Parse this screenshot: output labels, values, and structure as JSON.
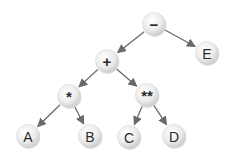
{
  "diagram": {
    "type": "expression-tree",
    "node_fill_light": "#fafafa",
    "node_fill_dark": "#d2d2d2",
    "edge_color": "#6a6a6a",
    "nodes": [
      {
        "id": "minus",
        "label": "−",
        "kind": "operator",
        "x": 154,
        "y": 24
      },
      {
        "id": "plus",
        "label": "+",
        "kind": "operator",
        "x": 107,
        "y": 61
      },
      {
        "id": "E",
        "label": "E",
        "kind": "operand",
        "x": 207,
        "y": 53
      },
      {
        "id": "times",
        "label": "*",
        "kind": "operator",
        "x": 69,
        "y": 96
      },
      {
        "id": "power",
        "label": "**",
        "kind": "operator",
        "x": 147,
        "y": 95
      },
      {
        "id": "A",
        "label": "A",
        "kind": "operand",
        "x": 28,
        "y": 136
      },
      {
        "id": "B",
        "label": "B",
        "kind": "operand",
        "x": 90,
        "y": 136
      },
      {
        "id": "C",
        "label": "C",
        "kind": "operand",
        "x": 129,
        "y": 137
      },
      {
        "id": "D",
        "label": "D",
        "kind": "operand",
        "x": 174,
        "y": 136
      }
    ],
    "edges": [
      {
        "from": "minus",
        "to": "plus"
      },
      {
        "from": "minus",
        "to": "E"
      },
      {
        "from": "plus",
        "to": "times"
      },
      {
        "from": "plus",
        "to": "power"
      },
      {
        "from": "times",
        "to": "A"
      },
      {
        "from": "times",
        "to": "B"
      },
      {
        "from": "power",
        "to": "C"
      },
      {
        "from": "power",
        "to": "D"
      }
    ]
  }
}
